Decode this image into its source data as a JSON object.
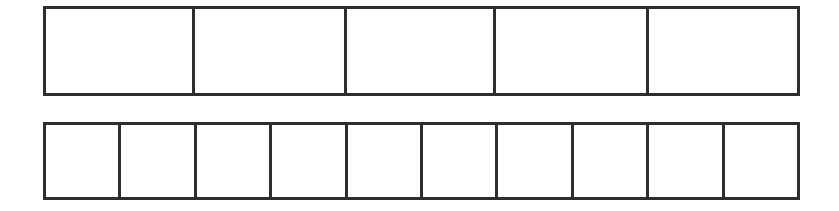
{
  "figure": {
    "background_color": "#ffffff",
    "line_color": "#2e2e2e",
    "line_width_px": 3
  },
  "chart_data": {
    "type": "bar",
    "title": "",
    "subtitle": "",
    "xlabel": "",
    "ylabel": "",
    "grid": false,
    "legend": "none",
    "categories": [
      "top-strip",
      "bottom-strip"
    ],
    "series": [
      {
        "name": "number_of_parts",
        "values": [
          5,
          10
        ]
      },
      {
        "name": "shaded_parts",
        "values": [
          0,
          0
        ]
      }
    ],
    "strips": [
      {
        "name": "top-strip",
        "parts": 5,
        "shaded": 0,
        "fraction_per_part": "1/5",
        "cells": [
          "",
          "",
          "",
          "",
          ""
        ]
      },
      {
        "name": "bottom-strip",
        "parts": 10,
        "shaded": 0,
        "fraction_per_part": "1/10",
        "cells": [
          "",
          "",
          "",
          "",
          "",
          "",
          "",
          "",
          "",
          ""
        ]
      }
    ]
  },
  "strips": {
    "top": {
      "label": "top-strip",
      "cells": [
        {
          "label": ""
        },
        {
          "label": ""
        },
        {
          "label": ""
        },
        {
          "label": ""
        },
        {
          "label": ""
        }
      ]
    },
    "bottom": {
      "label": "bottom-strip",
      "cells": [
        {
          "label": ""
        },
        {
          "label": ""
        },
        {
          "label": ""
        },
        {
          "label": ""
        },
        {
          "label": ""
        },
        {
          "label": ""
        },
        {
          "label": ""
        },
        {
          "label": ""
        },
        {
          "label": ""
        },
        {
          "label": ""
        }
      ]
    }
  }
}
